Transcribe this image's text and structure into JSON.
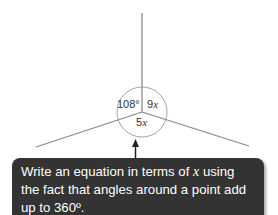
{
  "diagram": {
    "angles": [
      {
        "label_num": "108°",
        "label_var": "",
        "position": "left"
      },
      {
        "label_num": "9",
        "label_var": "x",
        "position": "right"
      },
      {
        "label_num": "5",
        "label_var": "x",
        "position": "bottom"
      }
    ],
    "line_color": "#8a8a8a",
    "circle_color": "#9a9a9a"
  },
  "callout": {
    "text_before": "Write an equation in terms of ",
    "variable": "x",
    "text_after": " using the fact that angles around a point add up to 360º.",
    "background": "#333333",
    "text_color": "#ffffff"
  }
}
